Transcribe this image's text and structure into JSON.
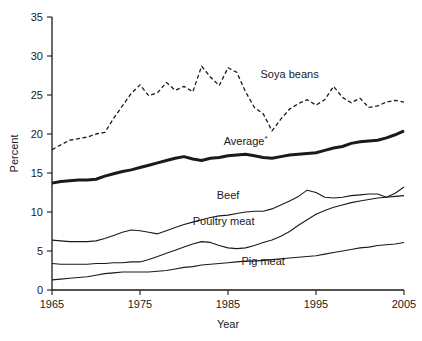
{
  "chart_data": {
    "type": "line",
    "title": "",
    "xlabel": "Year",
    "ylabel": "Percent",
    "xlim": [
      1965,
      2005
    ],
    "ylim": [
      0,
      35
    ],
    "xticks": [
      1965,
      1975,
      1985,
      1995,
      2005
    ],
    "yticks": [
      0,
      5,
      10,
      15,
      20,
      25,
      30,
      35
    ],
    "grid": false,
    "legend": "inline-labels",
    "x": [
      1965,
      1966,
      1967,
      1968,
      1969,
      1970,
      1971,
      1972,
      1973,
      1974,
      1975,
      1976,
      1977,
      1978,
      1979,
      1980,
      1981,
      1982,
      1983,
      1984,
      1985,
      1986,
      1987,
      1988,
      1989,
      1990,
      1991,
      1992,
      1993,
      1994,
      1995,
      1996,
      1997,
      1998,
      1999,
      2000,
      2001,
      2002,
      2003,
      2004,
      2005
    ],
    "series": [
      {
        "name": "Soya beans",
        "style": "dashed",
        "label": "Soya beans",
        "label_x": 1992.0,
        "label_y": 27.2,
        "values": [
          18.0,
          18.6,
          19.2,
          19.4,
          19.6,
          20.0,
          20.2,
          22.0,
          23.6,
          25.2,
          26.3,
          24.9,
          25.3,
          26.6,
          25.6,
          26.1,
          25.4,
          28.7,
          27.3,
          26.2,
          28.5,
          27.9,
          25.4,
          23.4,
          22.6,
          20.4,
          21.9,
          23.2,
          23.9,
          24.4,
          23.7,
          24.4,
          26.1,
          24.7,
          24.0,
          24.6,
          23.4,
          23.6,
          24.1,
          24.3,
          24.1
        ]
      },
      {
        "name": "Average",
        "style": "thick-solid",
        "label": "Average",
        "label_superscript": "*",
        "label_x": 1987.0,
        "label_y": 18.6,
        "values": [
          13.7,
          13.9,
          14.0,
          14.1,
          14.1,
          14.2,
          14.6,
          14.9,
          15.2,
          15.4,
          15.7,
          16.0,
          16.3,
          16.6,
          16.9,
          17.1,
          16.8,
          16.6,
          16.9,
          17.0,
          17.2,
          17.3,
          17.4,
          17.2,
          17.0,
          16.9,
          17.1,
          17.3,
          17.4,
          17.5,
          17.6,
          17.9,
          18.2,
          18.4,
          18.8,
          19.0,
          19.1,
          19.2,
          19.5,
          19.9,
          20.4
        ]
      },
      {
        "name": "Beef",
        "style": "solid",
        "label": "Beef",
        "label_x": 1985.0,
        "label_y": 11.7,
        "values": [
          6.4,
          6.3,
          6.2,
          6.2,
          6.2,
          6.3,
          6.6,
          7.0,
          7.4,
          7.7,
          7.6,
          7.4,
          7.2,
          7.6,
          8.0,
          8.4,
          8.7,
          9.0,
          9.3,
          9.5,
          9.6,
          9.8,
          10.0,
          10.1,
          10.1,
          10.4,
          10.9,
          11.4,
          12.0,
          12.8,
          12.5,
          11.9,
          11.8,
          11.9,
          12.1,
          12.2,
          12.3,
          12.3,
          11.9,
          12.4,
          13.2
        ]
      },
      {
        "name": "Poultry meat",
        "style": "solid",
        "label": "Poultry meat",
        "label_x": 1984.5,
        "label_y": 8.3,
        "values": [
          3.4,
          3.3,
          3.3,
          3.3,
          3.3,
          3.4,
          3.4,
          3.5,
          3.5,
          3.6,
          3.6,
          3.9,
          4.3,
          4.7,
          5.1,
          5.5,
          5.9,
          6.2,
          6.1,
          5.7,
          5.4,
          5.3,
          5.4,
          5.7,
          6.1,
          6.4,
          6.9,
          7.5,
          8.3,
          9.0,
          9.7,
          10.2,
          10.6,
          10.9,
          11.2,
          11.4,
          11.6,
          11.8,
          11.9,
          12.0,
          12.1
        ]
      },
      {
        "name": "Pig meat",
        "style": "solid",
        "label": "Pig meat",
        "label_x": 1989.0,
        "label_y": 3.2,
        "values": [
          1.3,
          1.4,
          1.5,
          1.6,
          1.7,
          1.9,
          2.1,
          2.2,
          2.3,
          2.3,
          2.3,
          2.3,
          2.4,
          2.5,
          2.7,
          2.9,
          3.0,
          3.2,
          3.3,
          3.4,
          3.5,
          3.6,
          3.7,
          3.7,
          3.8,
          3.9,
          4.0,
          4.1,
          4.2,
          4.3,
          4.4,
          4.6,
          4.8,
          5.0,
          5.2,
          5.4,
          5.5,
          5.7,
          5.8,
          5.9,
          6.1
        ]
      }
    ]
  }
}
